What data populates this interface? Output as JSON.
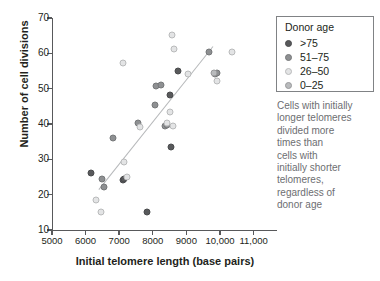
{
  "chart_data": {
    "type": "scatter",
    "title": "",
    "xlabel": "Initial telomere length (base pairs)",
    "ylabel": "Number of cell divisions",
    "xlim": [
      5000,
      11400
    ],
    "ylim": [
      10,
      70
    ],
    "xticks": [
      5000,
      6000,
      7000,
      8000,
      9000,
      10000,
      11000
    ],
    "xtick_labels": [
      "5000",
      "6000",
      "7000",
      "8000",
      "9000",
      "10,000",
      "11,000"
    ],
    "yticks": [
      10,
      20,
      30,
      40,
      50,
      60,
      70
    ],
    "ytick_labels": [
      "10",
      "20",
      "30",
      "40",
      "50",
      "60",
      "70"
    ],
    "grid": false,
    "legend_position": "top-right",
    "legend_title": "Donor age",
    "series": [
      {
        "name": ">75",
        "color": "#58595b",
        "marker_class": "g0",
        "points": [
          [
            6150,
            26.2
          ],
          [
            7100,
            24.2
          ],
          [
            7150,
            24.4
          ],
          [
            7830,
            15.2
          ],
          [
            8500,
            48.2
          ],
          [
            8550,
            33.4
          ],
          [
            8750,
            55.1
          ]
        ]
      },
      {
        "name": "51–75",
        "color": "#8e9092",
        "marker_class": "g1",
        "points": [
          [
            6500,
            24.3
          ],
          [
            6550,
            22.2
          ],
          [
            6820,
            36.1
          ],
          [
            7560,
            40.3
          ],
          [
            8080,
            45.3
          ],
          [
            8100,
            50.8
          ],
          [
            8230,
            50.9
          ],
          [
            8350,
            39.3
          ],
          [
            8420,
            39.7
          ],
          [
            9680,
            60.3
          ],
          [
            9860,
            54.2
          ],
          [
            9900,
            54.3
          ]
        ]
      },
      {
        "name": "26–50",
        "color": "#e3e4e5",
        "marker_class": "g2",
        "points": [
          [
            6300,
            18.5
          ],
          [
            6450,
            15.2
          ],
          [
            7120,
            57.2
          ],
          [
            7230,
            24.9
          ],
          [
            7150,
            29.3
          ],
          [
            7620,
            39.1
          ],
          [
            8420,
            40.4
          ],
          [
            8520,
            43.4
          ],
          [
            8560,
            65.3
          ],
          [
            8600,
            39.4
          ],
          [
            8620,
            61.2
          ],
          [
            9060,
            54.2
          ],
          [
            9900,
            52.1
          ],
          [
            10350,
            60.3
          ]
        ]
      },
      {
        "name": "0–25",
        "color": "#b9bbbd",
        "marker_class": "g3",
        "points": [
          [
            9830,
            54.4
          ]
        ]
      }
    ],
    "trend_line": {
      "x0": 6400,
      "y0": 21.5,
      "x1": 9800,
      "y1": 62.0,
      "color": "#b6b8ba"
    },
    "annotation_lines": [
      "Cells with initially",
      "longer telomeres",
      "divided more",
      "times than",
      "cells with",
      "initially shorter",
      "telomeres,",
      "regardless of",
      "donor age"
    ]
  }
}
